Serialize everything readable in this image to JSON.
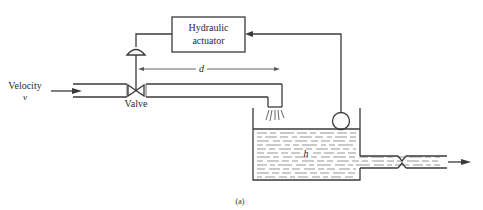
{
  "figure": {
    "caption": "(a)",
    "components": {
      "actuator": {
        "label_line1": "Hydraulic",
        "label_line2": "actuator"
      },
      "inlet": {
        "label": "Velocity",
        "symbol": "v"
      },
      "valve": {
        "label": "Valve"
      },
      "distance": {
        "symbol": "d"
      },
      "tank": {
        "level_symbol": "h"
      }
    },
    "colors": {
      "line": "#3a3a3a",
      "text": "#2a2a2a",
      "background": "#ffffff"
    }
  }
}
